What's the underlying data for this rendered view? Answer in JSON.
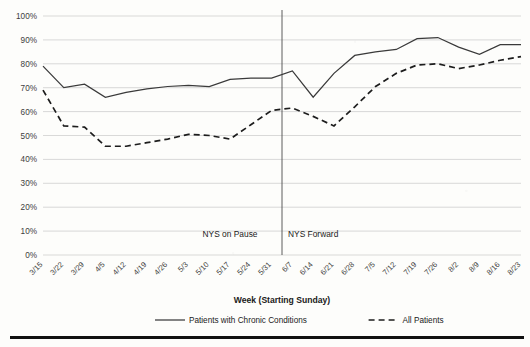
{
  "chart_data": {
    "type": "line",
    "title": "",
    "xlabel": "Week (Starting Sunday)",
    "ylabel": "",
    "ylim": [
      0,
      100
    ],
    "ytick_labels": [
      "0%",
      "10%",
      "20%",
      "30%",
      "40%",
      "50%",
      "60%",
      "70%",
      "80%",
      "90%",
      "100%"
    ],
    "ytick_values": [
      0,
      10,
      20,
      30,
      40,
      50,
      60,
      70,
      80,
      90,
      100
    ],
    "grid": true,
    "legend_position": "bottom",
    "categories": [
      "3/15",
      "3/22",
      "3/29",
      "4/5",
      "4/12",
      "4/19",
      "4/26",
      "5/3",
      "5/10",
      "5/17",
      "5/24",
      "5/31",
      "6/7",
      "6/14",
      "6/21",
      "6/28",
      "7/5",
      "7/12",
      "7/19",
      "7/26",
      "8/2",
      "8/9",
      "8/16",
      "8/23"
    ],
    "series": [
      {
        "name": "Patients with Chronic Conditions",
        "style": "solid",
        "color": "#3a3a3a",
        "values": [
          79,
          70,
          71.5,
          66,
          68,
          69.5,
          70.5,
          71,
          70.5,
          73.5,
          74,
          74,
          77,
          66,
          76,
          83.5,
          85,
          86,
          90.5,
          91,
          87,
          84,
          88,
          88
        ]
      },
      {
        "name": "All Patients",
        "style": "dashed",
        "color": "#1d1d1d",
        "values": [
          69,
          54,
          53.5,
          45.5,
          45.5,
          47,
          48.5,
          50.5,
          50,
          48.5,
          54.5,
          60.5,
          61.5,
          58,
          54,
          62,
          70.5,
          76,
          79.5,
          80,
          78,
          79.5,
          81.5,
          83
        ]
      }
    ],
    "annotations": [
      {
        "label": "NYS on Pause",
        "x": "5/17"
      },
      {
        "label": "NYS Forward",
        "x": "6/14"
      }
    ],
    "divider": {
      "after_category": "5/31"
    }
  },
  "legend": {
    "items": [
      {
        "label": "Patients with Chronic Conditions",
        "style": "solid"
      },
      {
        "label": "All Patients",
        "style": "dashed"
      }
    ]
  }
}
